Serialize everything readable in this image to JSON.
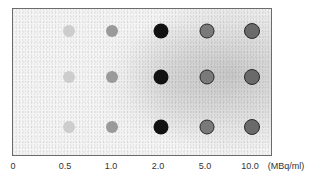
{
  "figure": {
    "type": "dot-blot autoradiograph",
    "rows": 3,
    "x_axis": {
      "unit_label": "(MBq/ml)",
      "ticks": [
        "0",
        "0.5",
        "1.0",
        "2.0",
        "5.0",
        "10.0"
      ]
    },
    "columns": [
      {
        "concentration": "0.5",
        "intensity": "faint",
        "color": "#c4c4c4",
        "size": 12
      },
      {
        "concentration": "1.0",
        "intensity": "light",
        "color": "#9a9a9a",
        "size": 12
      },
      {
        "concentration": "2.0",
        "intensity": "very dark",
        "color": "#111111",
        "size": 15
      },
      {
        "concentration": "5.0",
        "intensity": "medium with dark rim",
        "color": "#7a7a7a",
        "size": 15
      },
      {
        "concentration": "10.0",
        "intensity": "medium with dark rim",
        "color": "#6a6a6a",
        "size": 16
      }
    ]
  }
}
